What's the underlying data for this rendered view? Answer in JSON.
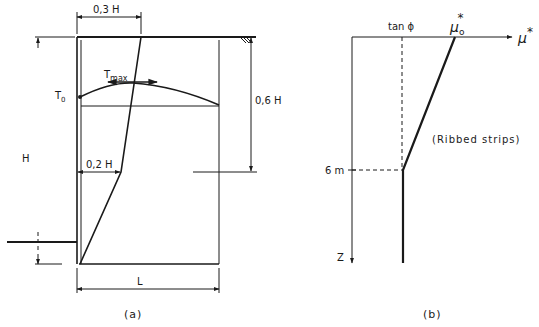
{
  "figure": {
    "panel_a": {
      "caption": "(a)",
      "labels": {
        "dim_top": "0,3 H",
        "dim_right": "0,6 H",
        "dim_mid": "0,2 H",
        "height": "H",
        "length": "L",
        "t_zero": "T",
        "t_zero_sub": "0",
        "t_max": "T",
        "t_max_sub": "max"
      }
    },
    "panel_b": {
      "caption": "(b)",
      "labels": {
        "tan_phi": "tan  ϕ",
        "mu0_star": "μ",
        "mu0_sub": "o",
        "mu0_sup": "*",
        "x_axis": "μ",
        "x_axis_sup": "*",
        "depth_mark": "6 m",
        "z_axis": "Z",
        "note": "(Ribbed strips)"
      }
    }
  },
  "colors": {
    "ink": "#1a1a1a",
    "background": "#ffffff"
  }
}
